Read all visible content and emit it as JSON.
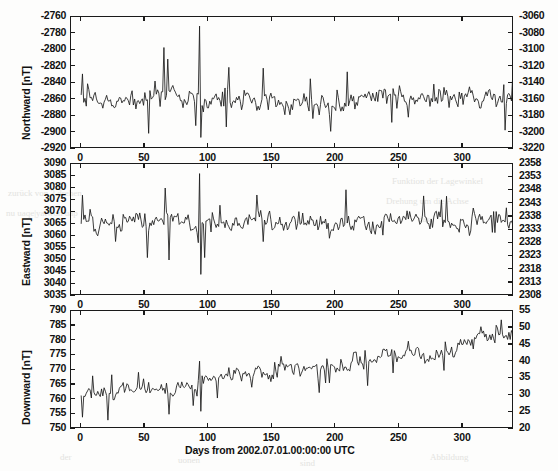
{
  "figure": {
    "background_color": "#fdfdfc",
    "line_color": "#1a1a1a",
    "axis_color": "#1a1a1a"
  },
  "xaxis": {
    "label": "Days from 2002.07.01.00:00:00 UTC",
    "ticks": [
      "0",
      "50",
      "100",
      "150",
      "200",
      "250",
      "300"
    ],
    "min": -8,
    "max": 340
  },
  "bleed_artifacts": [
    {
      "text": "zurück von 3  drehen",
      "x": 8,
      "y": 188
    },
    {
      "text": "nu uaqe|yatwon  uap",
      "x": 6,
      "y": 208
    },
    {
      "text": "Funktion der Lagewinkel",
      "x": 392,
      "y": 176
    },
    {
      "text": "Drehung um die Achse",
      "x": 386,
      "y": 196
    },
    {
      "text": "dass",
      "x": 418,
      "y": 214
    },
    {
      "text": "der",
      "x": 60,
      "y": 452
    },
    {
      "text": "uonen",
      "x": 178,
      "y": 455
    },
    {
      "text": "sind",
      "x": 300,
      "y": 458
    },
    {
      "text": "Abbildung",
      "x": 430,
      "y": 452
    }
  ],
  "chart_data": [
    {
      "type": "line",
      "panel": 1,
      "title": "",
      "ylabel": "Northward [nT]",
      "xlabel": "",
      "ylim": [
        -2920,
        -2760
      ],
      "yticks": [
        "-2760",
        "-2780",
        "-2800",
        "-2820",
        "-2840",
        "-2860",
        "-2880",
        "-2900",
        "-2920"
      ],
      "y2lim": [
        -3220,
        -3060
      ],
      "y2ticks": [
        "-3060",
        "-3080",
        "-3100",
        "-3120",
        "-3140",
        "-3160",
        "-3180",
        "-3200",
        "-3220"
      ],
      "xlim": [
        -8,
        340
      ],
      "grid": false,
      "legend": "none",
      "series": [
        {
          "name": "Northward component",
          "baseline": -2860,
          "noise_sigma": 13,
          "spikes": [
            {
              "x": 93,
              "y": -2771
            },
            {
              "x": 93.6,
              "y": -2906
            },
            {
              "x": 65,
              "y": -2797
            },
            {
              "x": 68,
              "y": -2811
            },
            {
              "x": 53,
              "y": -2901
            },
            {
              "x": 116,
              "y": -2821
            },
            {
              "x": 143,
              "y": -2822
            },
            {
              "x": 1,
              "y": -2829
            }
          ]
        }
      ]
    },
    {
      "type": "line",
      "panel": 2,
      "title": "",
      "ylabel": "Eastward [nT]",
      "xlabel": "",
      "ylim": [
        3035,
        3090
      ],
      "yticks": [
        "3090",
        "3085",
        "3080",
        "3075",
        "3070",
        "3065",
        "3060",
        "3055",
        "3050",
        "3045",
        "3040",
        "3035"
      ],
      "y2lim": [
        2308,
        2358
      ],
      "y2ticks": [
        "2358",
        "2353",
        "2348",
        "2343",
        "2338",
        "2333",
        "2328",
        "2323",
        "2318",
        "2313",
        "2308"
      ],
      "xlim": [
        -8,
        340
      ],
      "grid": false,
      "legend": "none",
      "series": [
        {
          "name": "Eastward component",
          "baseline": 3066,
          "noise_sigma": 4.2,
          "spikes": [
            {
              "x": 93,
              "y": 3086
            },
            {
              "x": 94,
              "y": 3044
            },
            {
              "x": 52,
              "y": 3051
            },
            {
              "x": 69,
              "y": 3050
            },
            {
              "x": 66,
              "y": 3080
            },
            {
              "x": 97,
              "y": 3051
            },
            {
              "x": 1,
              "y": 3077
            }
          ]
        }
      ]
    },
    {
      "type": "line",
      "panel": 3,
      "title": "",
      "ylabel": "Downward [nT]",
      "xlabel": "Days from 2002.07.01.00:00:00 UTC",
      "ylim": [
        750,
        790
      ],
      "yticks": [
        "790",
        "785",
        "780",
        "775",
        "770",
        "765",
        "760",
        "755",
        "750"
      ],
      "y2lim": [
        20,
        55
      ],
      "y2ticks": [
        "55",
        "50",
        "45",
        "40",
        "35",
        "30",
        "25",
        "20"
      ],
      "xlim": [
        -8,
        340
      ],
      "grid": false,
      "legend": "none",
      "series": [
        {
          "name": "Downward component",
          "trend_start": 760,
          "trend_end": 781,
          "noise_sigma": 3.0,
          "spikes": [
            {
              "x": 93,
              "y": 773
            },
            {
              "x": 94,
              "y": 756
            },
            {
              "x": 69,
              "y": 755
            },
            {
              "x": 21,
              "y": 753
            },
            {
              "x": 1,
              "y": 754
            },
            {
              "x": 245,
              "y": 769
            },
            {
              "x": 330,
              "y": 787
            }
          ]
        }
      ]
    }
  ]
}
